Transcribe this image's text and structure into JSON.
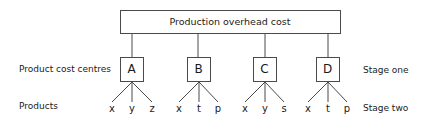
{
  "diagram": {
    "root": {
      "label": "Production overhead cost"
    },
    "left_labels": {
      "centres": "Product cost centres",
      "products": "Products"
    },
    "right_labels": {
      "stage_one": "Stage one",
      "stage_two": "Stage two"
    },
    "centres": [
      {
        "label": "A",
        "products": [
          "x",
          "y",
          "z"
        ]
      },
      {
        "label": "B",
        "products": [
          "x",
          "t",
          "p"
        ]
      },
      {
        "label": "C",
        "products": [
          "x",
          "y",
          "s"
        ]
      },
      {
        "label": "D",
        "products": [
          "x",
          "t",
          "p"
        ]
      }
    ],
    "colors": {
      "stroke": "#4a4a4a",
      "text": "#1a1a1a",
      "background": "#ffffff"
    }
  }
}
